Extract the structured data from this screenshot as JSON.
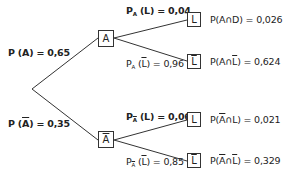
{
  "diagram": {
    "type": "probability-tree",
    "root": {
      "label": ""
    },
    "level1": [
      {
        "node": "A",
        "node_overline": false,
        "edge_label_prefix": "P (",
        "edge_label_event": "A",
        "edge_label_event_overline": false,
        "edge_label_suffix": ") = 0,65",
        "edge_label_bold": true
      },
      {
        "node": "A",
        "node_overline": true,
        "edge_label_prefix": "P (",
        "edge_label_event": "A",
        "edge_label_event_overline": true,
        "edge_label_suffix": ") = 0,35",
        "edge_label_bold": true
      }
    ],
    "level2": [
      {
        "parent": "A",
        "node": "L",
        "node_overline": false,
        "edge_label": {
          "p": "P",
          "sub": "A",
          "sub_overline": false,
          "event": "L",
          "event_overline": false,
          "value": " = 0,04",
          "bold": true
        },
        "result": {
          "prefix": "P(A",
          "cap": "∩",
          "event": "D",
          "event_overline": false,
          "a_overline": false,
          "value": ") = 0,026"
        }
      },
      {
        "parent": "A",
        "node": "L",
        "node_overline": true,
        "edge_label": {
          "p": "P",
          "sub": "A",
          "sub_overline": false,
          "event": "L",
          "event_overline": true,
          "value": " = 0,96",
          "bold": false
        },
        "result": {
          "prefix": "P(A",
          "cap": "∩",
          "event": "L",
          "event_overline": true,
          "a_overline": false,
          "value": ") = 0,624"
        }
      },
      {
        "parent": "Ā",
        "node": "L",
        "node_overline": false,
        "edge_label": {
          "p": "P",
          "sub": "A",
          "sub_overline": true,
          "event": "L",
          "event_overline": false,
          "value": " = 0,06",
          "bold": true
        },
        "result": {
          "prefix": "P(",
          "cap": "∩",
          "event": "L",
          "event_overline": false,
          "a_overline": true,
          "value": ") = 0,021"
        }
      },
      {
        "parent": "Ā",
        "node": "L",
        "node_overline": true,
        "edge_label": {
          "p": "P",
          "sub": "A",
          "sub_overline": true,
          "event": "L",
          "event_overline": true,
          "value": " = 0,85",
          "bold": false
        },
        "result": {
          "prefix": "P(",
          "cap": "∩",
          "event": "L",
          "event_overline": true,
          "a_overline": true,
          "value": ") = 0,329"
        }
      }
    ]
  },
  "text": {
    "pA": {
      "p": "P (",
      "ev": "A",
      "val": ") = 0,65"
    },
    "pAbar": {
      "p": "P (",
      "ev": "A",
      "val": ") = 0,35"
    },
    "nodeA": "A",
    "nodeAbar": "A",
    "nodeL1": "L",
    "nodeLbar1": "L",
    "nodeL2": "L",
    "nodeLbar2": "L",
    "e1": {
      "p": "P",
      "sub": "A",
      "open": " (",
      "ev": "L",
      "close": ")",
      "val": " = 0,04"
    },
    "e2": {
      "p": "P",
      "sub": "A",
      "open": " (",
      "ev": "L",
      "close": ")",
      "val": " = 0,96"
    },
    "e3": {
      "p": "P",
      "sub": "A",
      "open": " (",
      "ev": "L",
      "close": ")",
      "val": " = 0,06"
    },
    "e4": {
      "p": "P",
      "sub": "A",
      "open": " (",
      "ev": "L",
      "close": ")",
      "val": " = 0,85"
    },
    "r1": {
      "pre": "P(A",
      "cap": "∩",
      "ev": "D",
      "val": ") = 0,026"
    },
    "r2": {
      "pre": "P(A",
      "cap": "∩",
      "ev": "L",
      "val": ") = 0,624"
    },
    "r3": {
      "pre": "P(",
      "a": "A",
      "cap": "∩",
      "ev": "L",
      "val": ") = 0,021"
    },
    "r4": {
      "pre": "P(",
      "a": "A",
      "cap": "∩",
      "ev": "L",
      "val": ") = 0,329"
    }
  },
  "colors": {
    "line": "#333333",
    "text": "#222222",
    "background": "#ffffff"
  }
}
